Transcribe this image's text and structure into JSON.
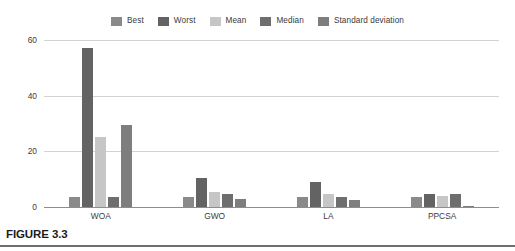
{
  "figure": {
    "caption": "FIGURE 3.3"
  },
  "chart_data": {
    "type": "bar",
    "title": "",
    "xlabel": "",
    "ylabel": "",
    "ylim": [
      0,
      60
    ],
    "yticks": [
      0,
      20,
      40,
      60
    ],
    "ytick_labels": [
      "0",
      "20",
      "40",
      "60"
    ],
    "grid": true,
    "legend_position": "top-center",
    "categories": [
      "WOA",
      "GWO",
      "LA",
      "PPCSA"
    ],
    "series": [
      {
        "name": "Best",
        "color": "#8a8a8a",
        "values": [
          3.5,
          3.5,
          3.5,
          3.5
        ]
      },
      {
        "name": "Worst",
        "color": "#636363",
        "values": [
          57,
          10.5,
          9,
          4.5
        ]
      },
      {
        "name": "Mean",
        "color": "#c6c6c6",
        "values": [
          25,
          5.5,
          4.8,
          4
        ]
      },
      {
        "name": "Median",
        "color": "#6e6e6e",
        "values": [
          3.5,
          4.8,
          3.5,
          4.5
        ]
      },
      {
        "name": "Standard deviation",
        "color": "#7e7e7e",
        "values": [
          29.5,
          3,
          2.5,
          0.3
        ]
      }
    ]
  },
  "colors": {
    "gridline": "#d2d2d2",
    "axis": "#8d8d8d",
    "text": "#3c3c3c",
    "caption": "#1c1c1c",
    "rule": "#6e6e6e",
    "background": "#ffffff"
  }
}
